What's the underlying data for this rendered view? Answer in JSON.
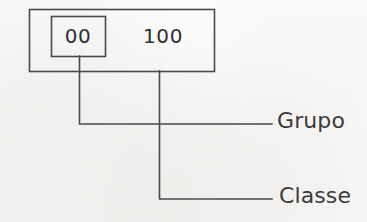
{
  "diagram": {
    "background_color": "#fbfbfa",
    "line_color": "#4a4a4a",
    "text_color": "#3b3b3b",
    "code": {
      "full_value": "00 100",
      "group_digits": "00",
      "class_digits": "100"
    },
    "callouts": [
      {
        "id": "grupo",
        "label": "Grupo",
        "points_to": "00",
        "leader_origin_x": 79,
        "leader_y": 124
      },
      {
        "id": "classe",
        "label": "Classe",
        "points_to": "100",
        "leader_origin_x": 159,
        "leader_y": 199
      }
    ],
    "outer_box": {
      "x": 29,
      "y": 9,
      "width": 185,
      "height": 62
    },
    "inner_box": {
      "x": 51,
      "y": 16,
      "width": 54,
      "height": 40
    }
  }
}
